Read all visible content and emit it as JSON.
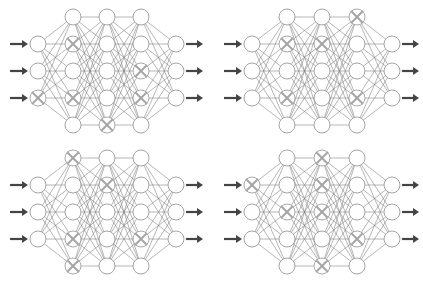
{
  "figure": {
    "colors": {
      "background": "#ffffff",
      "edge": "#7a7a7a",
      "node_stroke": "#9a9a9a",
      "dropped_mark": "#a6a6a6",
      "arrow": "#444444"
    },
    "layer_sizes": [
      3,
      5,
      5,
      5,
      3
    ],
    "node_radius": 8,
    "networks": [
      {
        "id": "top-left",
        "layer_x": [
          38,
          73,
          107,
          141,
          176
        ],
        "rows_3": [
          44,
          71,
          98
        ],
        "rows_5": [
          17,
          44,
          71,
          98,
          125
        ],
        "arrow_in_x": [
          10,
          28
        ],
        "arrow_out_x": [
          186,
          203
        ],
        "dropped": [
          [
            2
          ],
          [
            1,
            3
          ],
          [
            4
          ],
          [
            2,
            3
          ],
          []
        ]
      },
      {
        "id": "top-right",
        "layer_x": [
          252,
          287,
          322,
          357,
          392
        ],
        "rows_3": [
          44,
          71,
          98
        ],
        "rows_5": [
          17,
          44,
          71,
          98,
          125
        ],
        "arrow_in_x": [
          224,
          242
        ],
        "arrow_out_x": [
          402,
          419
        ],
        "dropped": [
          [],
          [
            1,
            3
          ],
          [
            1
          ],
          [
            0,
            3
          ],
          []
        ]
      },
      {
        "id": "bottom-left",
        "layer_x": [
          38,
          73,
          107,
          141,
          176
        ],
        "rows_3": [
          185,
          212,
          239
        ],
        "rows_5": [
          158,
          185,
          212,
          239,
          266
        ],
        "arrow_in_x": [
          10,
          28
        ],
        "arrow_out_x": [
          186,
          203
        ],
        "dropped": [
          [],
          [
            0,
            3,
            4
          ],
          [
            1
          ],
          [
            3
          ],
          []
        ]
      },
      {
        "id": "bottom-right",
        "layer_x": [
          252,
          287,
          322,
          357,
          392
        ],
        "rows_3": [
          185,
          212,
          239
        ],
        "rows_5": [
          158,
          185,
          212,
          239,
          266
        ],
        "arrow_in_x": [
          224,
          242
        ],
        "arrow_out_x": [
          402,
          419
        ],
        "dropped": [
          [
            0
          ],
          [
            2
          ],
          [
            0,
            1,
            2,
            4
          ],
          [
            3
          ],
          []
        ]
      }
    ]
  }
}
